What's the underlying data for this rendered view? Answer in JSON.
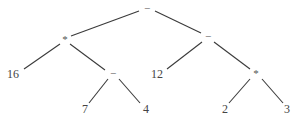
{
  "diagram": {
    "type": "expression-tree",
    "colors": {
      "edge": "#3a3a3a",
      "text": "#444444",
      "background": "#ffffff"
    },
    "nodes": [
      {
        "id": "n0",
        "label": "−",
        "kind": "operator",
        "x": 147,
        "y": 9
      },
      {
        "id": "n1",
        "label": "*",
        "kind": "operator",
        "x": 65,
        "y": 40
      },
      {
        "id": "n2",
        "label": "−",
        "kind": "operator",
        "x": 208,
        "y": 37
      },
      {
        "id": "n3",
        "label": "16",
        "kind": "operand",
        "x": 13,
        "y": 75
      },
      {
        "id": "n4",
        "label": "−",
        "kind": "operator",
        "x": 113,
        "y": 74
      },
      {
        "id": "n5",
        "label": "12",
        "kind": "operand",
        "x": 157,
        "y": 75
      },
      {
        "id": "n6",
        "label": "*",
        "kind": "operator",
        "x": 256,
        "y": 74
      },
      {
        "id": "n7",
        "label": "7",
        "kind": "operand",
        "x": 85,
        "y": 110
      },
      {
        "id": "n8",
        "label": "4",
        "kind": "operand",
        "x": 146,
        "y": 110
      },
      {
        "id": "n9",
        "label": "2",
        "kind": "operand",
        "x": 225,
        "y": 110
      },
      {
        "id": "n10",
        "label": "3",
        "kind": "operand",
        "x": 287,
        "y": 110
      }
    ],
    "edges": [
      {
        "from": "n0",
        "to": "n1",
        "x1": 139,
        "y1": 11,
        "x2": 71,
        "y2": 36
      },
      {
        "from": "n0",
        "to": "n2",
        "x1": 155,
        "y1": 11,
        "x2": 201,
        "y2": 33
      },
      {
        "from": "n1",
        "to": "n3",
        "x1": 60,
        "y1": 44,
        "x2": 24,
        "y2": 69
      },
      {
        "from": "n1",
        "to": "n4",
        "x1": 70,
        "y1": 44,
        "x2": 105,
        "y2": 70
      },
      {
        "from": "n2",
        "to": "n5",
        "x1": 202,
        "y1": 42,
        "x2": 167,
        "y2": 69
      },
      {
        "from": "n2",
        "to": "n6",
        "x1": 214,
        "y1": 42,
        "x2": 250,
        "y2": 69
      },
      {
        "from": "n4",
        "to": "n7",
        "x1": 108,
        "y1": 79,
        "x2": 89,
        "y2": 103
      },
      {
        "from": "n4",
        "to": "n8",
        "x1": 119,
        "y1": 79,
        "x2": 140,
        "y2": 103
      },
      {
        "from": "n6",
        "to": "n9",
        "x1": 250,
        "y1": 79,
        "x2": 229,
        "y2": 103
      },
      {
        "from": "n6",
        "to": "n10",
        "x1": 262,
        "y1": 79,
        "x2": 283,
        "y2": 103
      }
    ]
  }
}
